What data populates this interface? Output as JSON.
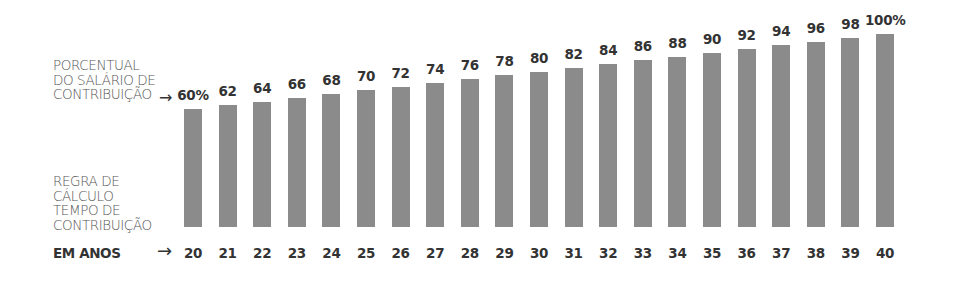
{
  "labels": {
    "percent_line1": "PORCENTUAL",
    "percent_line2": "DO SALÁRIO DE",
    "percent_line3": "CONTRIBUIÇÃO",
    "percent_arrow": "→",
    "rule_line1": "REGRA DE",
    "rule_line2": "CÁLCULO",
    "rule_line3": "TEMPO DE",
    "rule_line4": "CONTRIBUIÇÃO",
    "years_title": "EM ANOS",
    "years_arrow": "→"
  },
  "colors": {
    "bar": "#8b8b8b",
    "text": "#333333"
  },
  "chart_data": {
    "type": "bar",
    "title": "",
    "xlabel": "Tempo de contribuição em anos",
    "ylabel": "Porcentual do salário de contribuição",
    "categories": [
      "20",
      "21",
      "22",
      "23",
      "24",
      "25",
      "26",
      "27",
      "28",
      "29",
      "30",
      "31",
      "32",
      "33",
      "34",
      "35",
      "36",
      "37",
      "38",
      "39",
      "40"
    ],
    "values": [
      60,
      62,
      64,
      66,
      68,
      70,
      72,
      74,
      76,
      78,
      80,
      82,
      84,
      86,
      88,
      90,
      92,
      94,
      96,
      98,
      100
    ],
    "value_labels": [
      "60%",
      "62",
      "64",
      "66",
      "68",
      "70",
      "72",
      "74",
      "76",
      "78",
      "80",
      "82",
      "84",
      "86",
      "88",
      "90",
      "92",
      "94",
      "96",
      "98",
      "100%"
    ],
    "grid": false,
    "legend": null
  }
}
